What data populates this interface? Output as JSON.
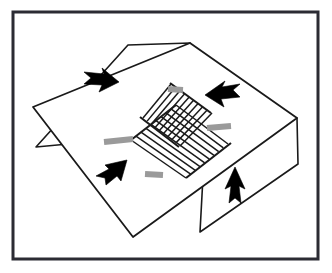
{
  "figure": {
    "title": "Isometric diagram of a folded sheet with a central ladder grid and four motion arrows",
    "caption": "",
    "canvas": {
      "width": 332,
      "height": 273
    },
    "background_color": "#ffffff",
    "border": {
      "name": "figure-border",
      "color": "#2b2b33",
      "thickness": 3,
      "x": 13,
      "y": 12,
      "width": 305,
      "height": 247
    },
    "stroke_color": "#1a1a1a",
    "fill_color": "#ffffff",
    "accent_gray": "#9a9a9a",
    "arrow_color": "#000000",
    "main_sheet": {
      "name": "main-sheet",
      "label": "main sheet",
      "points": "190,43 297,118 133,237 33,107"
    },
    "flap_top_left": {
      "name": "flap-top-left",
      "label": "upper-left flap",
      "points": "128,45 190,43 111,140 36,147"
    },
    "flap_bottom_right": {
      "name": "flap-bottom-right",
      "label": "lower-right flap",
      "points": "205,140 297,118 298,164 200,232"
    },
    "ladder_a": {
      "name": "ladder-grid-a",
      "label": "ladder grid A",
      "rails": [
        "143,118 180,146",
        "171,84 212,113"
      ],
      "rung_count": 9,
      "cap_color": "#9a9a9a"
    },
    "ladder_b": {
      "name": "ladder-grid-b",
      "label": "ladder grid B",
      "rails": [
        "131,140 176,105",
        "186,178 228,144"
      ],
      "rung_count": 9,
      "cap_color": "#9a9a9a"
    },
    "end_caps": [
      {
        "name": "end-cap-left",
        "label": "left end cap"
      },
      {
        "name": "end-cap-right",
        "label": "right end cap"
      },
      {
        "name": "end-cap-top",
        "label": "top end cap"
      },
      {
        "name": "end-cap-bottom",
        "label": "bottom end cap"
      }
    ],
    "arrows": [
      {
        "name": "arrow-top-left",
        "label": "arrow pointing right",
        "direction": "right",
        "tip": [
          116,
          84
        ],
        "tail": [
          84,
          78
        ]
      },
      {
        "name": "arrow-top-right",
        "label": "arrow pointing left",
        "direction": "left",
        "tip": [
          206,
          101
        ],
        "tail": [
          239,
          90
        ]
      },
      {
        "name": "arrow-bottom-left",
        "label": "arrow pointing up-right",
        "direction": "up-right",
        "tip": [
          124,
          162
        ],
        "tail": [
          97,
          184
        ]
      },
      {
        "name": "arrow-bottom-right",
        "label": "arrow pointing up",
        "direction": "up",
        "tip": [
          235,
          167
        ],
        "tail": [
          235,
          204
        ]
      }
    ]
  }
}
